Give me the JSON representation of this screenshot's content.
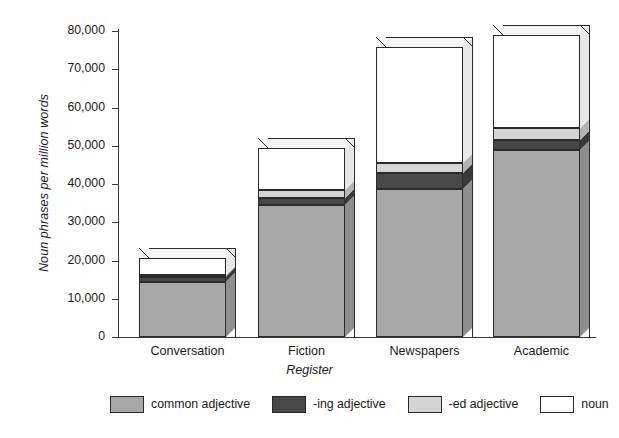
{
  "chart_data": {
    "type": "bar",
    "subtype": "stacked-bar-3d",
    "title": "",
    "xlabel": "Register",
    "ylabel": "Noun phrases per million words",
    "categories": [
      "Conversation",
      "Fiction",
      "Newspapers",
      "Academic"
    ],
    "series": [
      {
        "name": "common adjective",
        "color": "#a8a8a8",
        "values": [
          14500,
          34500,
          38700,
          48900
        ]
      },
      {
        "name": "-ing adjective",
        "color": "#474747",
        "values": [
          1300,
          1800,
          4200,
          2600
        ]
      },
      {
        "name": "-ed adjective",
        "color": "#d4d4d4",
        "values": [
          400,
          2100,
          2600,
          3100
        ]
      },
      {
        "name": "noun",
        "color": "#ffffff",
        "values": [
          4400,
          11000,
          30300,
          24400
        ]
      }
    ],
    "totals": [
      20600,
      49400,
      75800,
      79000
    ],
    "ylim": [
      0,
      80000
    ],
    "yticks": [
      0,
      10000,
      20000,
      30000,
      40000,
      50000,
      60000,
      70000,
      80000
    ],
    "ytick_labels": [
      "0",
      "10,000",
      "20,000",
      "30,000",
      "40,000",
      "50,000",
      "60,000",
      "70,000",
      "80,000"
    ],
    "grid": false,
    "legend_position": "bottom"
  },
  "legend": {
    "items": [
      {
        "label": "common adjective",
        "swatch": "#a8a8a8"
      },
      {
        "label": "-ing adjective",
        "swatch": "#474747"
      },
      {
        "label": "-ed adjective",
        "swatch": "#d4d4d4"
      },
      {
        "label": "noun",
        "swatch": "#ffffff"
      }
    ]
  }
}
